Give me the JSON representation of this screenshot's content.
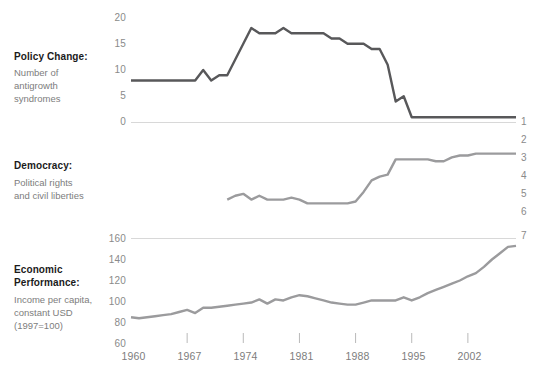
{
  "chart_data": [
    {
      "type": "line",
      "panel": "policy-change",
      "title": "Policy Change:",
      "subtitle": "Number of antigrowth syndromes",
      "subtitle_lines": [
        "Number of",
        "antigrowth",
        "syndromes"
      ],
      "ylabel": "Number of antigrowth syndromes",
      "xlabel": "",
      "ylim": [
        0,
        20
      ],
      "yticks": [
        0,
        5,
        10,
        15,
        20
      ],
      "ytick_labels": [
        "0",
        "5",
        "10",
        "15",
        "20"
      ],
      "y_axis_side": "left",
      "grid": false,
      "legend": "none",
      "line_color": "#58585a",
      "xlim": [
        1960,
        2008
      ],
      "x": [
        1960,
        1961,
        1962,
        1963,
        1964,
        1965,
        1966,
        1967,
        1968,
        1969,
        1970,
        1971,
        1972,
        1973,
        1974,
        1975,
        1976,
        1977,
        1978,
        1979,
        1980,
        1981,
        1982,
        1983,
        1984,
        1985,
        1986,
        1987,
        1988,
        1989,
        1990,
        1991,
        1992,
        1993,
        1994,
        1995,
        1996,
        1997,
        1998,
        1999,
        2000,
        2001,
        2002,
        2003,
        2004,
        2005,
        2006,
        2007,
        2008
      ],
      "values": [
        8,
        8,
        8,
        8,
        8,
        8,
        8,
        8,
        8,
        10,
        8,
        9,
        9,
        12,
        15,
        18,
        17,
        17,
        17,
        18,
        17,
        17,
        17,
        17,
        17,
        16,
        16,
        15,
        15,
        15,
        14,
        14,
        11,
        4,
        5,
        1,
        1,
        1,
        1,
        1,
        1,
        1,
        1,
        1,
        1,
        1,
        1,
        1,
        1
      ]
    },
    {
      "type": "line",
      "panel": "democracy",
      "title": "Democracy:",
      "subtitle": "Political rights and civil liberties",
      "subtitle_lines": [
        "Political rights",
        "and civil liberties"
      ],
      "ylabel": "Political rights and civil liberties",
      "xlabel": "",
      "ylim": [
        1,
        7
      ],
      "yticks": [
        1,
        2,
        3,
        4,
        5,
        6,
        7
      ],
      "ytick_labels": [
        "1",
        "2",
        "3",
        "4",
        "5",
        "6",
        "7"
      ],
      "y_axis_side": "right",
      "y_axis_inverted": true,
      "grid": false,
      "legend": "none",
      "line_color": "#9b9b9d",
      "xlim": [
        1960,
        2008
      ],
      "x": [
        1972,
        1973,
        1974,
        1975,
        1976,
        1977,
        1978,
        1979,
        1980,
        1981,
        1982,
        1983,
        1984,
        1985,
        1986,
        1987,
        1988,
        1989,
        1990,
        1991,
        1992,
        1993,
        1994,
        1995,
        1996,
        1997,
        1998,
        1999,
        2000,
        2001,
        2002,
        2003,
        2004,
        2005,
        2006,
        2007,
        2008
      ],
      "values": [
        5.1,
        4.9,
        4.8,
        5.1,
        4.9,
        5.1,
        5.1,
        5.1,
        5.0,
        5.1,
        5.3,
        5.3,
        5.3,
        5.3,
        5.3,
        5.3,
        5.2,
        4.7,
        4.1,
        3.9,
        3.8,
        3.0,
        3.0,
        3.0,
        3.0,
        3.0,
        3.1,
        3.1,
        2.9,
        2.8,
        2.8,
        2.7,
        2.7,
        2.7,
        2.7,
        2.7,
        2.7
      ]
    },
    {
      "type": "line",
      "panel": "economic-performance",
      "title_lines": [
        "Economic",
        "Performance:"
      ],
      "title": "Economic Performance:",
      "subtitle": "Income per capita, constant USD (1997=100)",
      "subtitle_lines": [
        "Income per capita,",
        "constant USD",
        "(1997=100)"
      ],
      "ylabel": "Income per capita, constant USD (1997=100)",
      "xlabel": "",
      "ylim": [
        60,
        160
      ],
      "yticks": [
        60,
        80,
        100,
        120,
        140,
        160
      ],
      "ytick_labels": [
        "60",
        "80",
        "100",
        "120",
        "140",
        "160"
      ],
      "y_axis_side": "left",
      "grid": false,
      "legend": "none",
      "line_color": "#9b9b9d",
      "xlim": [
        1960,
        2008
      ],
      "x": [
        1960,
        1961,
        1962,
        1963,
        1964,
        1965,
        1966,
        1967,
        1968,
        1969,
        1970,
        1971,
        1972,
        1973,
        1974,
        1975,
        1976,
        1977,
        1978,
        1979,
        1980,
        1981,
        1982,
        1983,
        1984,
        1985,
        1986,
        1987,
        1988,
        1989,
        1990,
        1991,
        1992,
        1993,
        1994,
        1995,
        1996,
        1997,
        1998,
        1999,
        2000,
        2001,
        2002,
        2003,
        2004,
        2005,
        2006,
        2007,
        2008
      ],
      "values": [
        85,
        84,
        85,
        86,
        87,
        88,
        90,
        92,
        89,
        94,
        94,
        95,
        96,
        97,
        98,
        99,
        102,
        98,
        102,
        101,
        104,
        106,
        105,
        103,
        101,
        99,
        98,
        97,
        97,
        99,
        101,
        101,
        101,
        101,
        104,
        101,
        104,
        108,
        111,
        114,
        117,
        120,
        124,
        127,
        133,
        140,
        146,
        152,
        153
      ]
    }
  ],
  "axes": {
    "x_tick_labels": [
      "1960",
      "1967",
      "1974",
      "1981",
      "1988",
      "1995",
      "2002"
    ],
    "x_tick_values": [
      1960,
      1967,
      1974,
      1981,
      1988,
      1995,
      2002
    ]
  },
  "panels": {
    "policy_change": {
      "title": "Policy Change:",
      "sub1": "Number of",
      "sub2": "antigrowth",
      "sub3": "syndromes",
      "y0": "0",
      "y5": "5",
      "y10": "10",
      "y15": "15",
      "y20": "20"
    },
    "democracy": {
      "title": "Democracy:",
      "sub1": "Political rights",
      "sub2": "and civil liberties",
      "y1": "1",
      "y2": "2",
      "y3": "3",
      "y4": "4",
      "y5": "5",
      "y6": "6",
      "y7": "7"
    },
    "economic": {
      "title1": "Economic",
      "title2": "Performance:",
      "sub1": "Income per capita,",
      "sub2": "constant USD",
      "sub3": "(1997=100)",
      "y60": "60",
      "y80": "80",
      "y100": "100",
      "y120": "120",
      "y140": "140",
      "y160": "160"
    }
  },
  "xaxis": {
    "t0": "1960",
    "t1": "1967",
    "t2": "1974",
    "t3": "1981",
    "t4": "1988",
    "t5": "1995",
    "t6": "2002"
  },
  "colors": {
    "dark_series": "#58585a",
    "light_series": "#9b9b9d",
    "axis_line": "#d8d8d8",
    "text_muted": "#7d7d7d",
    "text_strong": "#1b1b1b",
    "background": "#ffffff"
  }
}
